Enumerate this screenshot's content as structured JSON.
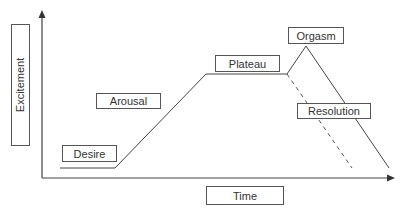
{
  "diagram": {
    "title": "",
    "axes": {
      "y_label": "Excitement",
      "x_label": "Time"
    },
    "phases": [
      {
        "id": "desire",
        "label": "Desire"
      },
      {
        "id": "arousal",
        "label": "Arousal"
      },
      {
        "id": "plateau",
        "label": "Plateau"
      },
      {
        "id": "orgasm",
        "label": "Orgasm"
      },
      {
        "id": "resolution",
        "label": "Resolution"
      }
    ],
    "curve": {
      "solid_path": [
        [
          60,
          168
        ],
        [
          115,
          168
        ],
        [
          206,
          74
        ],
        [
          287,
          74
        ],
        [
          306,
          46
        ],
        [
          389,
          168
        ]
      ],
      "dashed_path": [
        [
          287,
          74
        ],
        [
          352,
          168
        ]
      ],
      "color": "#444444"
    }
  }
}
